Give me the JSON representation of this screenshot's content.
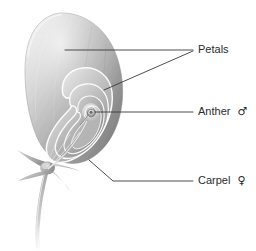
{
  "figure": {
    "background_color": "#ffffff",
    "line_color": "#3a3a3a",
    "text_color": "#2b2b2b",
    "illustration_tones": {
      "highlight": "#f2f2f2",
      "light": "#d8d8d8",
      "mid": "#b0b0b0",
      "shade": "#8d8d8d",
      "dark": "#6e6e6e",
      "outline": "#9a9a9a"
    }
  },
  "labels": [
    {
      "id": "petals",
      "name": "Petals",
      "text": "Petals",
      "symbol": "",
      "x": 198,
      "y": 50
    },
    {
      "id": "anther",
      "name": "Anther",
      "text": "Anther",
      "symbol": "♂",
      "x": 198,
      "y": 112
    },
    {
      "id": "carpel",
      "name": "Carpel",
      "text": "Carpel",
      "symbol": "♀",
      "x": 198,
      "y": 181
    }
  ],
  "leader_lines": [
    {
      "id": "petals-upper",
      "points": "65,50 193,50"
    },
    {
      "id": "petals-lower",
      "points": "104,90 193,51"
    },
    {
      "id": "anther",
      "points": "95,112 193,112"
    },
    {
      "id": "carpel",
      "points": "89,160 113,181 193,181"
    }
  ]
}
